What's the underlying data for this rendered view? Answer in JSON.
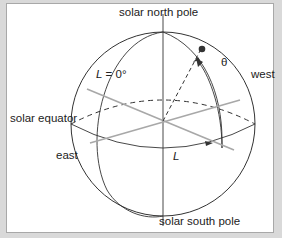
{
  "diagram": {
    "labels": {
      "north_pole": "solar north pole",
      "south_pole": "solar south pole",
      "equator": "solar equator",
      "east": "east",
      "west": "west",
      "meridian_zero_var": "L",
      "meridian_zero_rest": " = 0°",
      "longitude": "L",
      "theta": "θ"
    },
    "colors": {
      "outline": "#333333",
      "axis_gray": "#a8a8a8",
      "frame_border": "#a8a8a8",
      "background": "#d9d9d9"
    }
  }
}
